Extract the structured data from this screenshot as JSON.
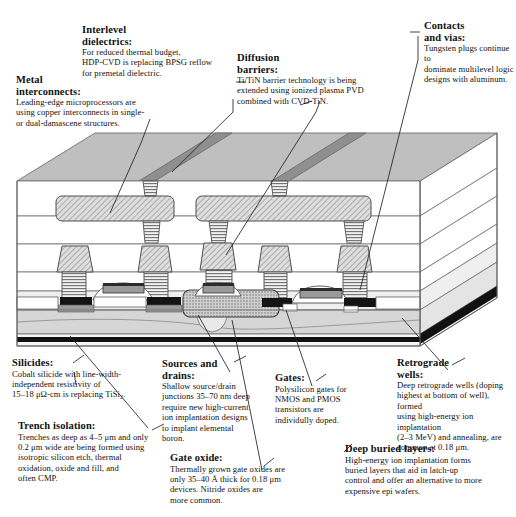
{
  "figure": {
    "type": "cross-section-diagram"
  },
  "callouts": [
    {
      "id": "metal-interconnects",
      "heading": "Metal\ninterconnects:",
      "heading_lines": [
        "Metal",
        "interconnects:"
      ],
      "body": "Leading-edge microprocessors are using copper interconnects in single- or dual-damascene structures.",
      "body_lines": [
        "Leading-edge microprocessors are",
        "using copper interconnects in single-",
        "or dual-damascene structures."
      ]
    },
    {
      "id": "interlevel-dielectrics",
      "heading_lines": [
        "Interlevel",
        "dielectrics:"
      ],
      "body": "For reduced thermal budget, HDP-CVD is replacing BPSG reflow for premetal dielectric.",
      "body_lines": [
        "For reduced thermal budget,",
        "HDP-CVD is replacing BPSG reflow",
        "for premetal dielectric."
      ]
    },
    {
      "id": "diffusion-barriers",
      "heading_lines": [
        "Diffusion",
        "barriers:"
      ],
      "body": "Ti/TiN barrier technology is being extended using ionized plasma PVD combined with CVD-TiN.",
      "body_lines": [
        "Ti/TiN barrier technology is being",
        "extended using ionized plasma PVD",
        "combined with CVD-TiN."
      ]
    },
    {
      "id": "contacts-and-vias",
      "heading_lines": [
        "Contacts",
        "and vias:"
      ],
      "body": "Tungsten plugs continue to dominate multilevel logic designs with aluminum.",
      "body_lines": [
        "Tungsten plugs continue to",
        "dominate multilevel logic",
        "designs with aluminum."
      ]
    },
    {
      "id": "silicides",
      "heading_lines": [
        "Silicides:"
      ],
      "body": "Cobalt silicide with line-width-independent resistivity of 15–18 μΩ-cm is replacing TiSi₂.",
      "body_lines": [
        "Cobalt silicide with line-width-",
        "independent resistivity of",
        "15–18 μΩ-cm is replacing TiSi₂."
      ]
    },
    {
      "id": "trench-isolation",
      "heading_lines": [
        "Trench isolation:"
      ],
      "body": "Trenches as deep as 4–5 μm and only 0.2 μm wide are being formed using isotropic silicon etch, thermal oxidation, oxide and fill, and often CMP.",
      "body_lines": [
        "Trenches as deep as 4–5 μm and only",
        "0.2 μm wide are being formed using",
        "isotropic silicon etch, thermal",
        "oxidation, oxide and fill, and",
        "often CMP."
      ]
    },
    {
      "id": "sources-and-drains",
      "heading_lines": [
        "Sources and",
        "drains:"
      ],
      "body": "Shallow source/drain junctions 35–70 nm deep require new high-current ion implantation designs to implant elemental boron.",
      "body_lines": [
        "Shallow source/drain",
        "junctions 35–70 nm deep",
        "require new high-current",
        "ion implantation designs",
        "to implant elemental",
        "boron."
      ]
    },
    {
      "id": "gate-oxide",
      "heading_lines": [
        "Gate oxide:"
      ],
      "body": "Thermally grown gate oxides are only 35–40 Å thick for 0.18 μm devices. Nitride oxides are more common.",
      "body_lines": [
        "Thermally grown gate oxides are",
        "only 35–40 Å thick for 0.18 μm",
        "devices. Nitride oxides are",
        "more common."
      ]
    },
    {
      "id": "gates",
      "heading_lines": [
        "Gates:"
      ],
      "body": "Polysilicon gates for NMOS and PMOS transistors are individully doped.",
      "body_lines": [
        "Polysilicon gates for",
        "NMOS and PMOS",
        "transistors are",
        "individully doped."
      ]
    },
    {
      "id": "retrograde-wells",
      "heading_lines": [
        "Retrograde",
        "wells:"
      ],
      "body": "Deep retrograde wells (doping highest at bottom of well), formed using high-energy ion implantation (2–3 MeV) and annealing, are common at 0.18 μm.",
      "body_lines": [
        "Deep retrograde wells (doping",
        "highest at bottom of well),  formed",
        "using high-energy ion implantation",
        "(2–3 MeV) and  annealing, are",
        "common  at 0.18 μm."
      ]
    },
    {
      "id": "deep-buried-layers",
      "heading_lines": [
        "Deep buried layers:"
      ],
      "body": "High-energy ion implantation forms buried layers that aid in latch-up control and offer an alternative to more expensive epi wafers.",
      "body_lines": [
        "High-energy ion implantation forms",
        "buried layers that aid in latch-up",
        "control and offer an alternative to more",
        "expensive epi wafers."
      ]
    }
  ],
  "colors": {
    "ink": "#111111",
    "outline": "#555555",
    "top_surface": "#bfbfbf",
    "metal_trench_dark": "#8a8a8a",
    "dielectric_light": "#ffffff",
    "dielectric_tint": "#efefef",
    "substrate_mid": "#d4d4d4",
    "substrate_light": "#e9e9e9",
    "silicide_black": "#111111",
    "gate_gray": "#9a9a9a",
    "hatch_fill": "#d9d9d9"
  }
}
